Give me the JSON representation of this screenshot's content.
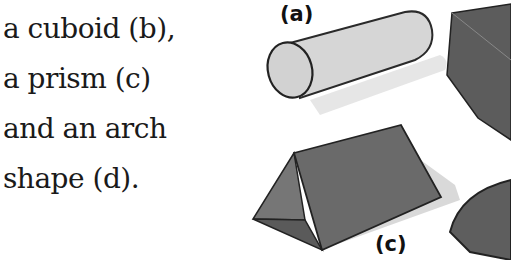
{
  "text": {
    "lines": [
      "a cuboid (b),",
      "a prism (c)",
      "and an arch",
      "shape (d)."
    ]
  },
  "figure": {
    "labels": {
      "a": "(a)",
      "c": "(c)"
    },
    "shapes": [
      {
        "id": "a",
        "name": "cylinder",
        "color": "#d9d9d9"
      },
      {
        "id": "b",
        "name": "cuboid",
        "color": "#5a5a5a"
      },
      {
        "id": "c",
        "name": "prism",
        "color": "#666666"
      },
      {
        "id": "d",
        "name": "arch",
        "color": "#606060"
      }
    ]
  }
}
